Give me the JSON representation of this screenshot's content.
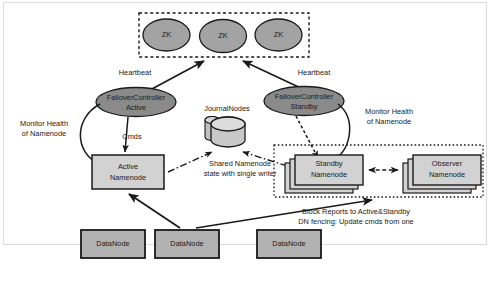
{
  "diagram": {
    "colors": {
      "zk_fill": "#a3a3a3",
      "failover_fill": "#8a8a8a",
      "namenode_fill": "#d2d2d2",
      "journalnode_fill": "#c8c8c8",
      "datanode_fill": "#b2b2b2",
      "stroke": "#1a1a1a",
      "frame": "#dcdcdc",
      "background": "#ffffff"
    },
    "zk_group": {
      "nodes": [
        {
          "label": "ZK"
        },
        {
          "label": "ZK"
        },
        {
          "label": "ZK"
        }
      ]
    },
    "failover_controllers": [
      {
        "line1": "FailoverController",
        "line2": "Active"
      },
      {
        "line1": "FailoverController",
        "line2": "Standby"
      }
    ],
    "journalnodes": {
      "label": "JournalNodes"
    },
    "namenodes": [
      {
        "line1": "Active",
        "line2": "Namenode"
      },
      {
        "line1": "Standby",
        "line2": "Namenode"
      },
      {
        "line1": "Observer",
        "line2": "Namenode"
      }
    ],
    "datanodes": [
      {
        "label": "DataNode"
      },
      {
        "label": "DataNode"
      },
      {
        "label": "DataNode"
      }
    ],
    "annotations": {
      "heartbeat_left": "Heartbeat",
      "heartbeat_right": "Heartbeat",
      "cmds": "Cmds",
      "monitor_left_line1": "Monitor Health",
      "monitor_left_line2": "of Namenode",
      "monitor_right_line1": "Monitor Health",
      "monitor_right_line2": "of Namenode",
      "shared_state_line1": "Shared Namenode",
      "shared_state_line2": "state with single writer",
      "block_reports_line1": "Block Reports to Active&Standby",
      "block_reports_line2": "DN fencing: Update cmds from one"
    }
  }
}
